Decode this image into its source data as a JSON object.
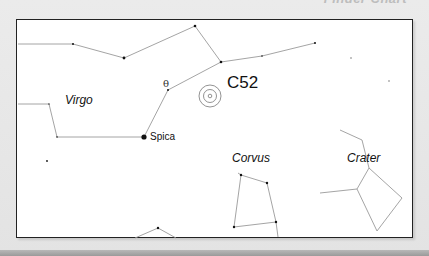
{
  "header": {
    "caption": "Finder Chart"
  },
  "chart": {
    "object": {
      "label": "C52",
      "x": 210,
      "y": 96
    },
    "constellations": [
      {
        "name": "Virgo",
        "label_x": 65,
        "label_y": 93
      },
      {
        "name": "Corvus",
        "label_x": 232,
        "label_y": 151
      },
      {
        "name": "Crater",
        "label_x": 347,
        "label_y": 151
      }
    ],
    "named_stars": [
      {
        "name": "Spica",
        "x": 144,
        "y": 137
      },
      {
        "name": "θ",
        "x": 168,
        "y": 87
      }
    ],
    "colors": {
      "frame": "#222222",
      "lines": "#999999",
      "stars": "#111111",
      "background": "#ffffff",
      "page": "#e6e6e6"
    }
  }
}
